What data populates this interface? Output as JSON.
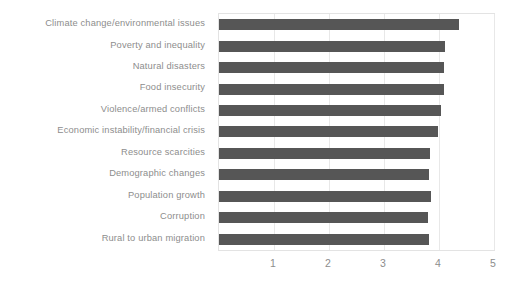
{
  "chart_data": {
    "type": "bar",
    "orientation": "horizontal",
    "title": "",
    "xlabel": "",
    "ylabel": "",
    "xlim": [
      0,
      5
    ],
    "xticks": [
      "1",
      "2",
      "3",
      "4",
      "5"
    ],
    "xtick_values": [
      1,
      2,
      3,
      4,
      5
    ],
    "grid": true,
    "legend": null,
    "bar_color": "#565656",
    "label_color": "#8d8d8d",
    "grid_color": "#e8e8e8",
    "categories": [
      "Climate change/environmental issues",
      "Poverty and inequality",
      "Natural disasters",
      "Food insecurity",
      "Violence/armed conflicts",
      "Economic instability/financial crisis",
      "Resource scarcities",
      "Demographic changes",
      "Population growth",
      "Corruption",
      "Rural to urban migration"
    ],
    "values": [
      4.36,
      4.11,
      4.09,
      4.09,
      4.04,
      3.98,
      3.84,
      3.82,
      3.85,
      3.8,
      3.82
    ]
  }
}
